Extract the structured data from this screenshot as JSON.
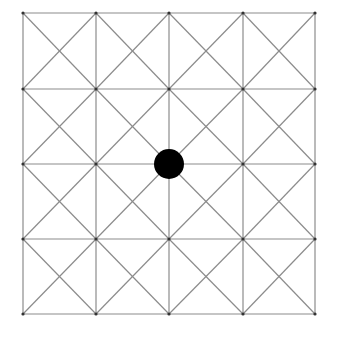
{
  "board": {
    "type": "alquerque-style-grid",
    "rows": 4,
    "cols": 4,
    "cell_diagonals": "both",
    "x_lines": [
      23,
      96,
      169,
      243,
      315
    ],
    "y_lines": [
      13,
      89,
      164,
      239,
      314
    ],
    "line_color": "#8c8c8c",
    "background": "#ffffff",
    "node_dot_color": "#333333"
  },
  "pieces": [
    {
      "color": "black",
      "fill": "#000000",
      "col": 2,
      "row": 2,
      "cx": 169,
      "cy": 164,
      "r": 15
    }
  ]
}
